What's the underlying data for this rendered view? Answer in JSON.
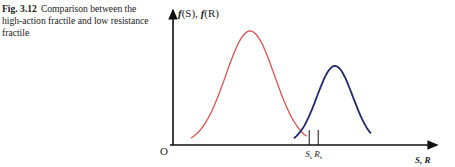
{
  "figure": {
    "label": "Fig. 3.12",
    "caption": "Comparison between the high-action fractile and low resistance fractile"
  },
  "chart_data": {
    "type": "line",
    "title": "",
    "ylabel_f": "f",
    "ylabel_text": "(S), ",
    "ylabel_f2": "f",
    "ylabel_text2": "(R)",
    "xlabel": "S, R",
    "origin_label": "O",
    "series": [
      {
        "name": "f(S)",
        "description": "load distribution",
        "color": "#d9534f",
        "mean": 0.3,
        "sd": 0.095
      },
      {
        "name": "f(R)",
        "description": "resistance distribution",
        "color": "#1f2a6b",
        "mean": 0.63,
        "sd": 0.07
      }
    ],
    "markers": [
      {
        "label": "S",
        "sub": "k",
        "x": 0.53
      },
      {
        "label": "R",
        "sub": "k",
        "x": 0.565
      }
    ],
    "xlim": [
      0,
      1
    ],
    "grid": false
  }
}
